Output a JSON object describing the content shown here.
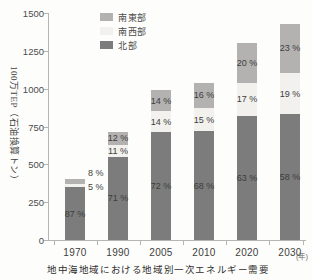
{
  "caption": "地中海地域における地域別一次エネルギー需要",
  "y_axis": {
    "unit_label": "100万TEP（石油換算トン）",
    "tick_labels": [
      "0",
      "250",
      "500",
      "750",
      "1000",
      "1250",
      "1500"
    ]
  },
  "x_axis": {
    "unit_label": "(年)"
  },
  "legend": {
    "items": [
      {
        "label": "南東部",
        "color": "#b3b2b0"
      },
      {
        "label": "南西部",
        "color": "#f2f1ed"
      },
      {
        "label": "北部",
        "color": "#7c7c7c"
      }
    ]
  },
  "colors": {
    "north": "#7c7c7c",
    "southwest": "#f2f1ed",
    "southeast": "#b3b2b0",
    "axis": "#b5b5b2",
    "background": "#fdfdfb"
  },
  "chart_data": {
    "type": "bar",
    "stacked": true,
    "title": "地中海地域における地域別一次エネルギー需要",
    "ylabel": "100万TEP（石油換算トン）",
    "xlabel": "年",
    "ylim": [
      0,
      1500
    ],
    "y_ticks": [
      0,
      250,
      500,
      750,
      1000,
      1250,
      1500
    ],
    "grid": false,
    "legend_position": "top-left-inside",
    "categories": [
      "1970",
      "1990",
      "2005",
      "2010",
      "2020",
      "2030"
    ],
    "totals_million_tep": [
      400,
      715,
      990,
      1040,
      1300,
      1430
    ],
    "series": [
      {
        "name": "北部",
        "unit": "%",
        "values": [
          87,
          71,
          72,
          68,
          63,
          58
        ]
      },
      {
        "name": "南西部",
        "unit": "%",
        "values": [
          5,
          11,
          14,
          15,
          17,
          19
        ]
      },
      {
        "name": "南東部",
        "unit": "%",
        "values": [
          8,
          12,
          14,
          16,
          20,
          23
        ]
      }
    ],
    "pct_suffix": " %"
  }
}
